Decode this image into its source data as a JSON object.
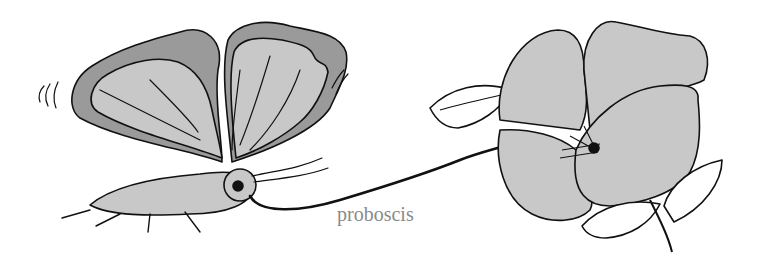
{
  "diagram": {
    "labels": [
      {
        "id": "proboscis",
        "text": "proboscis",
        "x": 337,
        "y": 218
      }
    ],
    "colors": {
      "fill": "#c8c8c8",
      "wing_border_fill": "#9a9a9a",
      "stroke": "#111111",
      "label": "#8a8a8a",
      "background": "#ffffff"
    }
  }
}
